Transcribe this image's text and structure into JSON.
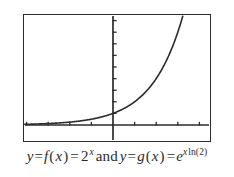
{
  "figure": {
    "name": "exponential-function-graph",
    "caption": {
      "lhs_y": "y",
      "eq1": "=",
      "f_name": "f",
      "f_open": "(",
      "f_var": "x",
      "f_close": ")",
      "eq2": "=",
      "base": "2",
      "exp1": "x",
      "conjunction": "and",
      "rhs_y": "y",
      "eq3": "=",
      "g_name": "g",
      "g_open": "(",
      "g_var": "x",
      "g_close": ")",
      "eq4": "=",
      "e_base": "e",
      "exp2_var": "x",
      "exp2_fn": "ln(2)",
      "full_text": "y = f(x) = 2^x and y = g(x) = e^(x ln(2))"
    },
    "colors": {
      "curve": "#2b2b2b",
      "axis": "#2b2b2b",
      "frame": "#2b2b2b",
      "background": "#ffffff",
      "text": "#2b2b2b"
    }
  },
  "chart_data": {
    "type": "line",
    "title": "",
    "subtitle": "",
    "xlabel": "",
    "ylabel": "",
    "xlim": [
      -4.2,
      4.2
    ],
    "ylim": [
      -0.9,
      9.6
    ],
    "grid": false,
    "legend": false,
    "axes": {
      "x_axis_y_value": 0,
      "y_axis_x_value": 0,
      "x_ticks": [
        -4,
        -3,
        -2,
        -1,
        1,
        2,
        3,
        4
      ],
      "y_ticks": [
        1,
        2,
        3,
        4,
        5,
        6,
        7,
        8,
        9
      ],
      "x_tick_labels": [],
      "y_tick_labels": []
    },
    "series": [
      {
        "name": "y = f(x) = 2^x  (identical to y = g(x) = e^(x ln 2))",
        "equation": "2^x",
        "x": [
          -4.2,
          -4.0,
          -3.5,
          -3.0,
          -2.5,
          -2.0,
          -1.5,
          -1.0,
          -0.5,
          0.0,
          0.5,
          1.0,
          1.5,
          2.0,
          2.5,
          3.0,
          3.2
        ],
        "values": [
          0.054,
          0.063,
          0.088,
          0.125,
          0.177,
          0.25,
          0.354,
          0.5,
          0.707,
          1.0,
          1.414,
          2.0,
          2.828,
          4.0,
          5.657,
          8.0,
          9.19
        ]
      }
    ],
    "annotations": []
  }
}
